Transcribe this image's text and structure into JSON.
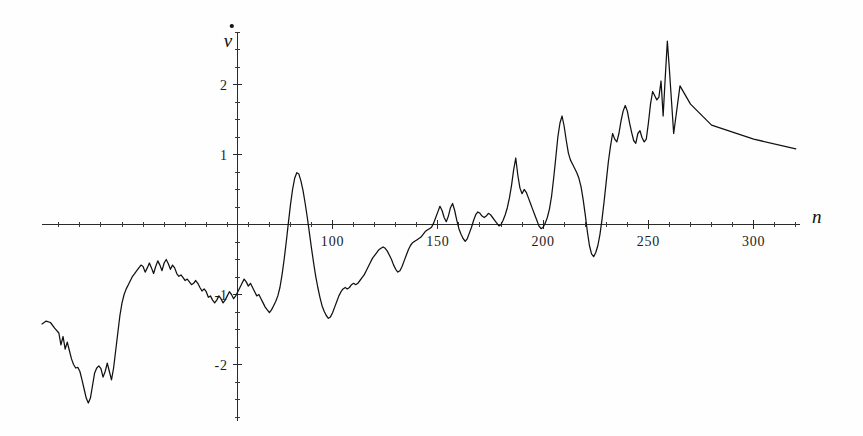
{
  "figure": {
    "background": "#fefefe",
    "ink_color": "#111111",
    "width": 863,
    "height": 436
  },
  "chart_data": {
    "type": "line",
    "title": "",
    "subtitle": "",
    "xlabel": "n",
    "ylabel": "v̇",
    "ylabel_plain": "v-dot",
    "legend": [],
    "legend_position": "none",
    "grid": false,
    "xlim": [
      -38,
      322
    ],
    "ylim": [
      -2.85,
      2.95
    ],
    "xticks_major": [
      100,
      150,
      200,
      250,
      300
    ],
    "xtick_labels": [
      "100",
      "150",
      "200",
      "250",
      "300"
    ],
    "xticks_minor_step": 10,
    "yticks_major": [
      -2,
      -1,
      1,
      2
    ],
    "ytick_labels": [
      "-2",
      "-1",
      "1",
      "2"
    ],
    "yticks_minor_step": 0.25,
    "vertical_axis_at_x": 55,
    "horizontal_axis_at_y": 0,
    "x": [
      -38,
      -36,
      -34,
      -32,
      -30,
      -29,
      -28,
      -27,
      -26,
      -25,
      -24,
      -23,
      -22,
      -21,
      -20,
      -19,
      -18,
      -17,
      -16,
      -15,
      -14,
      -13,
      -12,
      -11,
      -10,
      -9,
      -8,
      -7,
      -6,
      -5,
      -4,
      -3,
      -2,
      -1,
      0,
      1,
      2,
      3,
      4,
      5,
      6,
      7,
      8,
      9,
      10,
      11,
      12,
      13,
      14,
      15,
      16,
      17,
      18,
      19,
      20,
      21,
      22,
      23,
      24,
      25,
      26,
      27,
      28,
      29,
      30,
      31,
      32,
      33,
      34,
      35,
      36,
      37,
      38,
      39,
      40,
      41,
      42,
      43,
      44,
      45,
      46,
      47,
      48,
      49,
      50,
      51,
      52,
      53,
      54,
      55,
      56,
      57,
      58,
      59,
      60,
      61,
      62,
      63,
      64,
      65,
      66,
      67,
      68,
      69,
      70,
      71,
      72,
      73,
      74,
      75,
      76,
      77,
      78,
      79,
      80,
      81,
      82,
      83,
      84,
      85,
      86,
      87,
      88,
      89,
      90,
      91,
      92,
      93,
      94,
      95,
      96,
      97,
      98,
      99,
      100,
      101,
      102,
      103,
      104,
      105,
      106,
      107,
      108,
      109,
      110,
      111,
      112,
      113,
      114,
      115,
      116,
      117,
      118,
      119,
      120,
      121,
      122,
      123,
      124,
      125,
      126,
      127,
      128,
      129,
      130,
      131,
      132,
      133,
      134,
      135,
      136,
      137,
      138,
      139,
      140,
      141,
      142,
      143,
      144,
      145,
      146,
      147,
      148,
      149,
      150,
      151,
      152,
      153,
      154,
      155,
      156,
      157,
      158,
      159,
      160,
      161,
      162,
      163,
      164,
      165,
      166,
      167,
      168,
      169,
      170,
      171,
      172,
      173,
      174,
      175,
      176,
      177,
      178,
      179,
      180,
      181,
      182,
      183,
      184,
      185,
      186,
      187,
      188,
      189,
      190,
      191,
      192,
      193,
      194,
      195,
      196,
      197,
      198,
      199,
      200,
      201,
      202,
      203,
      204,
      205,
      206,
      207,
      208,
      209,
      210,
      211,
      212,
      213,
      214,
      215,
      216,
      217,
      218,
      219,
      220,
      221,
      222,
      223,
      224,
      225,
      226,
      227,
      228,
      229,
      230,
      231,
      232,
      233,
      234,
      235,
      236,
      237,
      238,
      239,
      240,
      241,
      242,
      243,
      244,
      245,
      246,
      247,
      248,
      249,
      250,
      251,
      252,
      253,
      254,
      255,
      256,
      257,
      258,
      259,
      260,
      262,
      265,
      270,
      280,
      300,
      320
    ],
    "y": [
      -1.42,
      -1.38,
      -1.4,
      -1.48,
      -1.55,
      -1.72,
      -1.6,
      -1.78,
      -1.68,
      -1.8,
      -1.92,
      -2.0,
      -2.05,
      -2.04,
      -2.1,
      -2.22,
      -2.35,
      -2.48,
      -2.55,
      -2.48,
      -2.3,
      -2.12,
      -2.05,
      -2.02,
      -2.06,
      -2.18,
      -2.1,
      -1.98,
      -2.1,
      -2.22,
      -2.05,
      -1.8,
      -1.55,
      -1.3,
      -1.12,
      -1.0,
      -0.92,
      -0.86,
      -0.8,
      -0.74,
      -0.7,
      -0.66,
      -0.62,
      -0.58,
      -0.6,
      -0.68,
      -0.62,
      -0.55,
      -0.62,
      -0.7,
      -0.6,
      -0.52,
      -0.58,
      -0.66,
      -0.55,
      -0.5,
      -0.56,
      -0.64,
      -0.58,
      -0.62,
      -0.7,
      -0.74,
      -0.72,
      -0.76,
      -0.8,
      -0.78,
      -0.82,
      -0.86,
      -0.84,
      -0.8,
      -0.84,
      -0.9,
      -0.95,
      -0.92,
      -0.96,
      -1.04,
      -1.02,
      -1.08,
      -1.12,
      -1.08,
      -1.02,
      -1.06,
      -1.12,
      -1.08,
      -1.02,
      -0.96,
      -1.0,
      -1.06,
      -1.02,
      -0.96,
      -0.9,
      -0.84,
      -0.78,
      -0.82,
      -0.88,
      -0.84,
      -0.9,
      -0.96,
      -1.02,
      -1.0,
      -1.06,
      -1.12,
      -1.18,
      -1.22,
      -1.26,
      -1.22,
      -1.16,
      -1.1,
      -1.02,
      -0.9,
      -0.72,
      -0.5,
      -0.25,
      0.02,
      0.28,
      0.5,
      0.66,
      0.74,
      0.72,
      0.62,
      0.48,
      0.3,
      0.1,
      -0.12,
      -0.34,
      -0.55,
      -0.74,
      -0.9,
      -1.04,
      -1.16,
      -1.24,
      -1.3,
      -1.34,
      -1.32,
      -1.26,
      -1.18,
      -1.1,
      -1.02,
      -0.96,
      -0.92,
      -0.9,
      -0.92,
      -0.9,
      -0.86,
      -0.84,
      -0.86,
      -0.84,
      -0.8,
      -0.76,
      -0.72,
      -0.66,
      -0.6,
      -0.54,
      -0.48,
      -0.44,
      -0.4,
      -0.36,
      -0.34,
      -0.32,
      -0.34,
      -0.38,
      -0.44,
      -0.5,
      -0.58,
      -0.64,
      -0.68,
      -0.66,
      -0.6,
      -0.52,
      -0.44,
      -0.36,
      -0.3,
      -0.26,
      -0.24,
      -0.22,
      -0.2,
      -0.18,
      -0.14,
      -0.1,
      -0.08,
      -0.06,
      -0.04,
      0.02,
      0.1,
      0.18,
      0.26,
      0.2,
      0.1,
      0.04,
      0.12,
      0.24,
      0.3,
      0.2,
      0.06,
      -0.06,
      -0.14,
      -0.2,
      -0.24,
      -0.2,
      -0.12,
      -0.04,
      0.06,
      0.14,
      0.18,
      0.16,
      0.12,
      0.1,
      0.12,
      0.16,
      0.14,
      0.1,
      0.06,
      0.02,
      -0.02,
      0.0,
      0.06,
      0.14,
      0.24,
      0.38,
      0.56,
      0.78,
      0.95,
      0.7,
      0.52,
      0.44,
      0.5,
      0.46,
      0.38,
      0.3,
      0.22,
      0.14,
      0.06,
      -0.02,
      -0.06,
      -0.04,
      0.02,
      0.1,
      0.22,
      0.4,
      0.66,
      0.95,
      1.25,
      1.45,
      1.55,
      1.4,
      1.2,
      1.02,
      0.92,
      0.86,
      0.8,
      0.74,
      0.66,
      0.54,
      0.36,
      0.14,
      -0.1,
      -0.3,
      -0.42,
      -0.46,
      -0.4,
      -0.3,
      -0.14,
      0.08,
      0.34,
      0.62,
      0.9,
      1.12,
      1.3,
      1.22,
      1.18,
      1.3,
      1.48,
      1.62,
      1.7,
      1.62,
      1.46,
      1.32,
      1.2,
      1.16,
      1.3,
      1.34,
      1.24,
      1.18,
      1.22,
      1.45,
      1.72,
      1.9,
      1.84,
      1.78,
      1.82,
      2.05,
      1.55,
      2.1,
      2.62,
      2.2,
      1.3,
      1.98,
      1.72,
      1.42,
      1.22,
      1.08,
      0.98,
      0.9,
      0.84,
      0.78,
      0.7,
      0.62,
      0.58,
      0.8,
      0.74,
      0.62,
      0.04,
      0.0,
      0.0,
      0.0,
      0.0,
      0.0,
      0.0
    ]
  },
  "annotations": {
    "y_axis_symbol": "v̇",
    "x_axis_symbol": "n"
  }
}
